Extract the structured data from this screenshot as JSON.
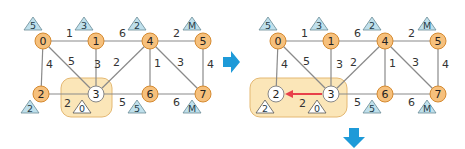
{
  "colors": {
    "visited_node_fill": "#f6c07c",
    "visited_node_stroke": "#d58a30",
    "current_node_fill": "#ffffff",
    "current_node_stroke": "#888888",
    "edge": "#8a8a8a",
    "highlight_box_fill": "#fbe6b8",
    "highlight_box_stroke": "#e4b872",
    "triangle_fill": "#bfe0ec",
    "arrow_blue": "#1e9ad8",
    "update_arrow_red": "#e8404a"
  },
  "panels": [
    {
      "id": "before",
      "nodes": [
        {
          "id": "0",
          "label": "0",
          "state": "visited",
          "dist": "5"
        },
        {
          "id": "1",
          "label": "1",
          "state": "visited",
          "dist": "3"
        },
        {
          "id": "4",
          "label": "4",
          "state": "visited",
          "dist": "2"
        },
        {
          "id": "5",
          "label": "5",
          "state": "visited",
          "dist": "M"
        },
        {
          "id": "2",
          "label": "2",
          "state": "visited",
          "dist": "2"
        },
        {
          "id": "3",
          "label": "3",
          "state": "current",
          "dist": "0"
        },
        {
          "id": "6",
          "label": "6",
          "state": "visited",
          "dist": "5"
        },
        {
          "id": "7",
          "label": "7",
          "state": "visited",
          "dist": "M"
        }
      ],
      "edges": [
        {
          "from": "0",
          "to": "1",
          "weight": "1"
        },
        {
          "from": "1",
          "to": "4",
          "weight": "6"
        },
        {
          "from": "4",
          "to": "5",
          "weight": "2"
        },
        {
          "from": "0",
          "to": "2",
          "weight": "4"
        },
        {
          "from": "0",
          "to": "3",
          "weight": "5"
        },
        {
          "from": "1",
          "to": "3",
          "weight": "3"
        },
        {
          "from": "3",
          "to": "4",
          "weight": "2"
        },
        {
          "from": "4",
          "to": "6",
          "weight": "1"
        },
        {
          "from": "4",
          "to": "7",
          "weight": "3"
        },
        {
          "from": "5",
          "to": "7",
          "weight": "4"
        },
        {
          "from": "2",
          "to": "3",
          "weight": "2"
        },
        {
          "from": "3",
          "to": "6",
          "weight": "5"
        },
        {
          "from": "6",
          "to": "7",
          "weight": "6"
        }
      ],
      "highlighted": [
        "3"
      ]
    },
    {
      "id": "after",
      "nodes": [
        {
          "id": "0",
          "label": "0",
          "state": "visited",
          "dist": "5"
        },
        {
          "id": "1",
          "label": "1",
          "state": "visited",
          "dist": "3"
        },
        {
          "id": "4",
          "label": "4",
          "state": "visited",
          "dist": "2"
        },
        {
          "id": "5",
          "label": "5",
          "state": "visited",
          "dist": "M"
        },
        {
          "id": "2",
          "label": "2",
          "state": "current",
          "dist": "2"
        },
        {
          "id": "3",
          "label": "3",
          "state": "current",
          "dist": "0"
        },
        {
          "id": "6",
          "label": "6",
          "state": "visited",
          "dist": "5"
        },
        {
          "id": "7",
          "label": "7",
          "state": "visited",
          "dist": "M"
        }
      ],
      "edges": [
        {
          "from": "0",
          "to": "1",
          "weight": "1"
        },
        {
          "from": "1",
          "to": "4",
          "weight": "6"
        },
        {
          "from": "4",
          "to": "5",
          "weight": "2"
        },
        {
          "from": "0",
          "to": "2",
          "weight": "4"
        },
        {
          "from": "0",
          "to": "3",
          "weight": "5"
        },
        {
          "from": "1",
          "to": "3",
          "weight": "3"
        },
        {
          "from": "3",
          "to": "4",
          "weight": "2"
        },
        {
          "from": "4",
          "to": "6",
          "weight": "1"
        },
        {
          "from": "4",
          "to": "7",
          "weight": "3"
        },
        {
          "from": "5",
          "to": "7",
          "weight": "4"
        },
        {
          "from": "2",
          "to": "3",
          "weight": "2"
        },
        {
          "from": "3",
          "to": "6",
          "weight": "5"
        },
        {
          "from": "6",
          "to": "7",
          "weight": "6"
        }
      ],
      "highlighted": [
        "2",
        "3"
      ],
      "selected_edge": {
        "from": "3",
        "to": "2",
        "weight": "2"
      }
    }
  ],
  "arrows": [
    {
      "name": "next-step-right-arrow",
      "direction": "right"
    },
    {
      "name": "next-step-down-arrow",
      "direction": "down"
    }
  ]
}
